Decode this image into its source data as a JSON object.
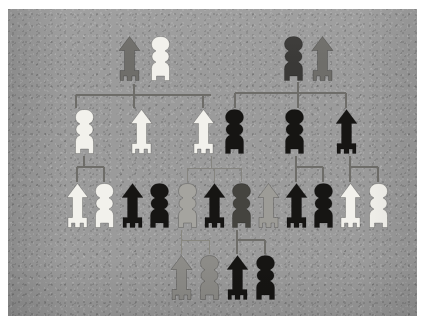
{
  "photo": {
    "title": "Tactile pedigree chart",
    "background_color": "#9b9b9b",
    "border_color": "#ffffff",
    "caption": ""
  },
  "legend": {
    "male_shape": "arrow-figure",
    "female_shape": "round-figure",
    "colors": {
      "white": "#f2f1ec",
      "black": "#161513",
      "dark_gray": "#4e4d4b",
      "mid_gray": "#7b7a76",
      "light_gray": "#a5a49f"
    }
  },
  "chart_data": {
    "type": "diagram",
    "diagram_kind": "pedigree",
    "generations": 4,
    "figure_count": 24,
    "rows": [
      {
        "row": 1,
        "label": "generation-1",
        "y": 26,
        "figures": [
          {
            "id": "I-1",
            "sex": "male",
            "shape": "arrow-figure",
            "color": "#6f6e6a",
            "tone": "mid_gray",
            "x": 108
          },
          {
            "id": "I-2",
            "sex": "female",
            "shape": "round-figure",
            "color": "#f2f1ec",
            "tone": "white",
            "x": 139
          },
          {
            "id": "I-3",
            "sex": "female",
            "shape": "round-figure",
            "color": "#3a3937",
            "tone": "dark_gray",
            "x": 272
          },
          {
            "id": "I-4",
            "sex": "male",
            "shape": "arrow-figure",
            "color": "#6f6e6a",
            "tone": "mid_gray",
            "x": 301
          }
        ]
      },
      {
        "row": 2,
        "label": "generation-2",
        "y": 99,
        "figures": [
          {
            "id": "II-1",
            "sex": "female",
            "shape": "round-figure",
            "color": "#f2f1ec",
            "tone": "white",
            "x": 63
          },
          {
            "id": "II-2",
            "sex": "male",
            "shape": "arrow-figure",
            "color": "#f2f1ec",
            "tone": "white",
            "x": 120
          },
          {
            "id": "II-3",
            "sex": "male",
            "shape": "arrow-figure",
            "color": "#f2f1ec",
            "tone": "white",
            "x": 182
          },
          {
            "id": "II-4",
            "sex": "female",
            "shape": "round-figure",
            "color": "#161513",
            "tone": "black",
            "x": 213
          },
          {
            "id": "II-5",
            "sex": "female",
            "shape": "round-figure",
            "color": "#161513",
            "tone": "black",
            "x": 273
          },
          {
            "id": "II-6",
            "sex": "male",
            "shape": "arrow-figure",
            "color": "#161513",
            "tone": "black",
            "x": 325
          }
        ]
      },
      {
        "row": 3,
        "label": "generation-3",
        "y": 173,
        "figures": [
          {
            "id": "III-1",
            "sex": "male",
            "shape": "arrow-figure",
            "color": "#f2f1ec",
            "tone": "white",
            "x": 56
          },
          {
            "id": "III-2",
            "sex": "female",
            "shape": "round-figure",
            "color": "#f2f1ec",
            "tone": "white",
            "x": 83
          },
          {
            "id": "III-3",
            "sex": "male",
            "shape": "arrow-figure",
            "color": "#161513",
            "tone": "black",
            "x": 111
          },
          {
            "id": "III-4",
            "sex": "female",
            "shape": "round-figure",
            "color": "#161513",
            "tone": "black",
            "x": 138
          },
          {
            "id": "III-5",
            "sex": "female",
            "shape": "round-figure",
            "color": "#a5a49f",
            "tone": "light_gray",
            "x": 166
          },
          {
            "id": "III-6",
            "sex": "male",
            "shape": "arrow-figure",
            "color": "#161513",
            "tone": "black",
            "x": 193
          },
          {
            "id": "III-7",
            "sex": "female",
            "shape": "round-figure",
            "color": "#45443f",
            "tone": "dark_gray",
            "x": 220
          },
          {
            "id": "III-8",
            "sex": "male",
            "shape": "arrow-figure",
            "color": "#9d9c97",
            "tone": "light_gray",
            "x": 247
          },
          {
            "id": "III-9",
            "sex": "male",
            "shape": "arrow-figure",
            "color": "#161513",
            "tone": "black",
            "x": 275
          },
          {
            "id": "III-10",
            "sex": "female",
            "shape": "round-figure",
            "color": "#161513",
            "tone": "black",
            "x": 302
          },
          {
            "id": "III-11",
            "sex": "male",
            "shape": "arrow-figure",
            "color": "#f2f1ec",
            "tone": "white",
            "x": 329
          },
          {
            "id": "III-12",
            "sex": "female",
            "shape": "round-figure",
            "color": "#f2f1ec",
            "tone": "white",
            "x": 357
          }
        ]
      },
      {
        "row": 4,
        "label": "generation-4",
        "y": 245,
        "figures": [
          {
            "id": "IV-1",
            "sex": "male",
            "shape": "arrow-figure",
            "color": "#8d8c88",
            "tone": "mid_gray",
            "x": 160
          },
          {
            "id": "IV-2",
            "sex": "female",
            "shape": "round-figure",
            "color": "#8d8c88",
            "tone": "mid_gray",
            "x": 188
          },
          {
            "id": "IV-3",
            "sex": "male",
            "shape": "arrow-figure",
            "color": "#161513",
            "tone": "black",
            "x": 216
          },
          {
            "id": "IV-4",
            "sex": "female",
            "shape": "round-figure",
            "color": "#161513",
            "tone": "black",
            "x": 244
          }
        ]
      }
    ],
    "connections": [
      {
        "id": "c1",
        "kind": "couple-drop",
        "from": "I-1 + I-2",
        "description": "descent line from generation-1 left couple"
      },
      {
        "id": "c2",
        "kind": "sibship-bar",
        "children": [
          "II-1",
          "II-2",
          "II-3"
        ],
        "description": "left sibship bracket"
      },
      {
        "id": "c3",
        "kind": "couple-drop",
        "from": "I-3 + I-4",
        "description": "descent line from generation-1 right couple"
      },
      {
        "id": "c4",
        "kind": "sibship-bar",
        "children": [
          "II-4",
          "II-5",
          "II-6"
        ],
        "description": "right sibship bracket"
      },
      {
        "id": "c5",
        "kind": "sibship-bar",
        "children": [
          "III-1",
          "III-2"
        ],
        "description": "children of II-1"
      },
      {
        "id": "c6",
        "kind": "sibship-bar",
        "children": [
          "III-5",
          "III-6",
          "III-7"
        ],
        "description": "children of II-3 + II-4"
      },
      {
        "id": "c7",
        "kind": "sibship-bar",
        "children": [
          "III-9",
          "III-10"
        ],
        "description": "children of II-5"
      },
      {
        "id": "c8",
        "kind": "sibship-bar",
        "children": [
          "III-11",
          "III-12"
        ],
        "description": "children of II-6"
      },
      {
        "id": "c9",
        "kind": "sibship-bar",
        "children": [
          "IV-1",
          "IV-2"
        ],
        "description": "children of III-8 line"
      },
      {
        "id": "c10",
        "kind": "sibship-bar",
        "children": [
          "IV-3",
          "IV-4"
        ],
        "description": "children of III-9 + III-10"
      }
    ]
  }
}
